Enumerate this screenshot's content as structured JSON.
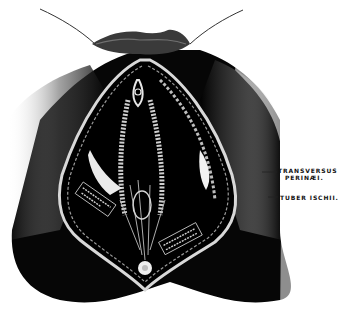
{
  "figure": {
    "colors": {
      "background": "#ffffff",
      "ink": "#050505",
      "highlight": "#e8e8e8",
      "mid_gray": "#8a8a8a"
    }
  },
  "labels": {
    "transversus_perinaei": {
      "line1": "TRANSVERSUS",
      "line2": "PERINÆI."
    },
    "tuber_ischii": {
      "text": "TUBER ISCHII."
    }
  }
}
